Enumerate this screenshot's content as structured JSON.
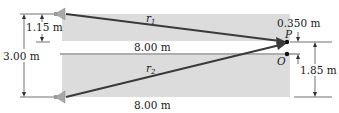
{
  "diagram": {
    "labels": {
      "r1": "r",
      "r1_sub": "1",
      "r2": "r",
      "r2_sub": "2",
      "P": "P",
      "O": "O",
      "dist_top": "8.00 m",
      "dist_bottom": "8.00 m",
      "dim_1_15": "1.15 m",
      "dim_3_00": "3.00 m",
      "dim_0_350": "0.350 m",
      "dim_1_85": "1.85 m"
    },
    "colors": {
      "shade": "#dcdcdc",
      "ray": "#3a3a3a",
      "speaker": "#a8a8a8",
      "line": "#333333"
    }
  }
}
